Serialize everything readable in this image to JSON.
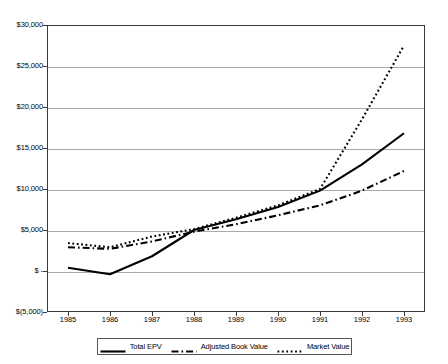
{
  "chart_data": {
    "type": "line",
    "title": "",
    "xlabel": "",
    "ylabel": "",
    "categories": [
      "1985",
      "1986",
      "1987",
      "1988",
      "1989",
      "1990",
      "1991",
      "1992",
      "1993"
    ],
    "ylim": [
      -5000,
      30000
    ],
    "ytick_values": [
      30000,
      25000,
      20000,
      15000,
      10000,
      5000,
      0,
      -5000
    ],
    "ytick_labels": [
      "$30,000",
      "$25,000",
      "$20,000",
      "$15,000",
      "$10,000",
      "$5,000",
      "$ -",
      "$(5,000)"
    ],
    "grid": true,
    "legend_position": "bottom",
    "series": [
      {
        "name": "Total EPV",
        "style": "solid",
        "color": "#000000",
        "values": [
          400,
          -400,
          1800,
          5000,
          6300,
          7800,
          9800,
          13000,
          16800
        ]
      },
      {
        "name": "Adjusted Book Value",
        "style": "dash-dot",
        "color": "#000000",
        "values": [
          2900,
          2700,
          3600,
          4800,
          5700,
          6800,
          8000,
          9800,
          12200
        ]
      },
      {
        "name": "Market Value",
        "style": "dotted",
        "color": "#000000",
        "values": [
          3400,
          2900,
          4200,
          5100,
          6500,
          8000,
          10000,
          18500,
          27500
        ]
      }
    ]
  },
  "legend": {
    "items": [
      {
        "label": "Total EPV"
      },
      {
        "label": "Adjusted Book Value"
      },
      {
        "label": "Market Value"
      }
    ]
  },
  "colors": {
    "axis": "#3a3a3a",
    "gridline": "#a9a9a9",
    "series": "#000000",
    "background": "#ffffff"
  }
}
